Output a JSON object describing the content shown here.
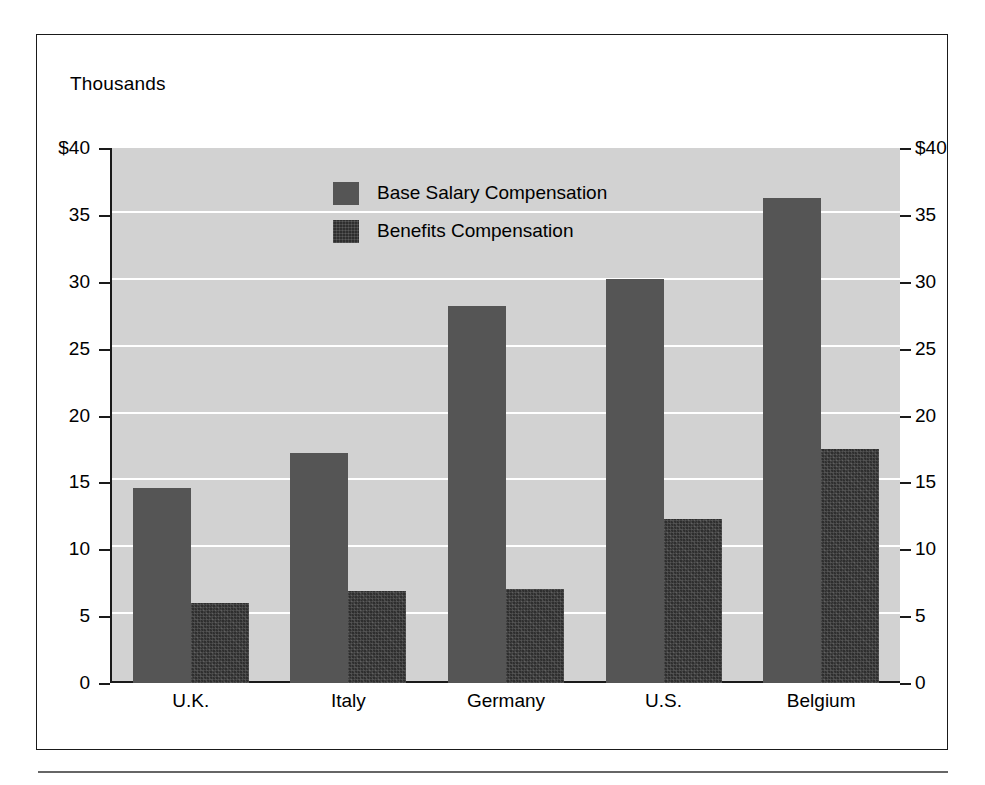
{
  "figure": {
    "units_caption": "Thousands"
  },
  "chart_data": {
    "type": "bar",
    "title": "",
    "subtitle": "",
    "units_caption": "Thousands",
    "xlabel": "",
    "ylabel": "Thousands",
    "categories": [
      "U.K.",
      "Italy",
      "Germany",
      "U.S.",
      "Belgium"
    ],
    "series": [
      {
        "name": "Base Salary Compensation",
        "color": "#555555",
        "values": [
          14.6,
          17.2,
          28.2,
          30.2,
          36.3
        ]
      },
      {
        "name": "Benefits Compensation",
        "color": "#2e2e2e",
        "values": [
          6.0,
          6.9,
          7.0,
          12.3,
          17.5
        ]
      }
    ],
    "ylim": [
      0,
      40
    ],
    "ytick_values": [
      40,
      35,
      30,
      25,
      20,
      15,
      10,
      5,
      0
    ],
    "ytick_labels_left": [
      "$40",
      "35",
      "30",
      "25",
      "20",
      "15",
      "10",
      "5",
      "0"
    ],
    "ytick_labels_right": [
      "$40",
      "35",
      "30",
      "25",
      "20",
      "15",
      "10",
      "5",
      "0"
    ],
    "dual_axis": true,
    "grid": true,
    "grid_color": "#ffffff",
    "plot_background": "#d2d2d2",
    "legend_position": "inside-top-center",
    "legend_entries": [
      "Base Salary Compensation",
      "Benefits Compensation"
    ]
  }
}
